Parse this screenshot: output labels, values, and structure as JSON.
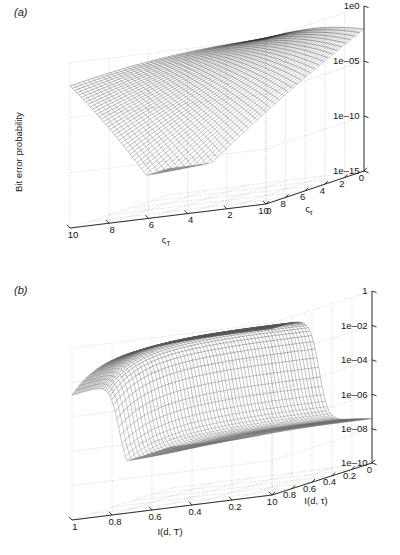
{
  "figure": {
    "background": "#ffffff",
    "panels": [
      "a",
      "b"
    ]
  },
  "panel_a": {
    "label": "(a)",
    "zlabel": "Bit error probability",
    "xlabel": "ςᴛ",
    "ylabel": "ςᴛ",
    "xlabel_base": "ς",
    "xlabel_sub": "τ",
    "ylabel_base": "ς",
    "ylabel_sub": "T",
    "z_ticks": [
      "1e0",
      "1e–05",
      "1e–10",
      "1e–15"
    ],
    "x_ticks": [
      "0",
      "2",
      "4",
      "6",
      "8",
      "10"
    ],
    "y_ticks": [
      "0",
      "2",
      "4",
      "6",
      "8",
      "10"
    ]
  },
  "panel_b": {
    "label": "(b)",
    "zlabel": "Bit error probability",
    "xlabel": "I(d, τ)",
    "ylabel": "I(d, T)",
    "z_ticks": [
      "1",
      "1e–02",
      "1e–04",
      "1e–06",
      "1e–08",
      "1e–10"
    ],
    "x_ticks": [
      "0",
      "0.2",
      "0.4",
      "0.6",
      "0.8",
      "1"
    ],
    "y_ticks": [
      "0",
      "0.2",
      "0.4",
      "0.6",
      "0.8",
      "1"
    ]
  },
  "chart_data": [
    {
      "type": "surface",
      "panel": "a",
      "title": "",
      "xlabel": "ςτ",
      "ylabel": "ςT",
      "zlabel": "Bit error probability",
      "xlim": [
        0,
        10
      ],
      "ylim": [
        0,
        10
      ],
      "zlim_log10": [
        -15,
        0
      ],
      "z_scale": "log",
      "z_tick_values": [
        1,
        1e-05,
        1e-10,
        1e-15
      ],
      "x_tick_values": [
        0,
        2,
        4,
        6,
        8,
        10
      ],
      "y_tick_values": [
        0,
        2,
        4,
        6,
        8,
        10
      ],
      "grid": true,
      "legend": "none",
      "description": "Monotonically decreasing bit error probability surface, maximum ~1e0 at (x=0,y=0) corner and minimum ~1e-12 toward the far (x=10,y=10) corner; mesh wireframe drawn in greyscale.",
      "surface_model": {
        "formula_log10_z": "-0.12 * (x*y) - 0.02*(x*x + y*y)",
        "nx": 41,
        "ny": 41
      },
      "sample_grid_log10_z": [
        [
          0.0,
          -0.3,
          -0.9,
          -1.9,
          -3.3,
          -5.0
        ],
        [
          -0.3,
          -0.9,
          -1.9,
          -3.3,
          -5.0,
          -7.1
        ],
        [
          -0.9,
          -1.9,
          -3.3,
          -5.0,
          -7.1,
          -9.5
        ],
        [
          -1.9,
          -3.3,
          -5.0,
          -7.1,
          -9.5,
          -11.0
        ],
        [
          -3.3,
          -5.0,
          -7.1,
          -9.5,
          -11.0,
          -11.8
        ],
        [
          -5.0,
          -7.1,
          -9.5,
          -11.0,
          -11.8,
          -12.3
        ]
      ]
    },
    {
      "type": "surface",
      "panel": "b",
      "title": "",
      "xlabel": "I(d, τ)",
      "ylabel": "I(d, T)",
      "zlabel": "Bit error probability",
      "xlim": [
        0,
        1
      ],
      "ylim": [
        0,
        1
      ],
      "zlim_log10": [
        -10,
        0
      ],
      "z_scale": "log",
      "z_tick_values": [
        1,
        0.01,
        0.0001,
        1e-06,
        1e-08,
        1e-10
      ],
      "x_tick_values": [
        0,
        0.2,
        0.4,
        0.6,
        0.8,
        1
      ],
      "y_tick_values": [
        0,
        0.2,
        0.4,
        0.6,
        0.8,
        1
      ],
      "grid": true,
      "legend": "none",
      "description": "Plateau near 1 for small I(d,tau) then a sharp cliff dropping several decades; the surface falls off steeply near I(d,tau)~0.45 and again at the far I(d,T)~1 edge, bottoming near 1e-7.",
      "surface_model": {
        "formula_log10_z": "plateau then steep cliff in x, mild decay in y",
        "nx": 61,
        "ny": 61
      },
      "sample_grid_log10_z": [
        [
          -0.1,
          -0.15,
          -0.2,
          -0.3,
          -0.5,
          -1.2
        ],
        [
          -0.15,
          -0.2,
          -0.3,
          -0.45,
          -0.8,
          -1.9
        ],
        [
          -0.3,
          -0.4,
          -0.6,
          -0.9,
          -1.5,
          -3.0
        ],
        [
          -0.9,
          -1.2,
          -1.6,
          -2.2,
          -3.2,
          -5.0
        ],
        [
          -2.6,
          -3.0,
          -3.6,
          -4.3,
          -5.2,
          -6.6
        ],
        [
          -5.0,
          -5.3,
          -5.7,
          -6.1,
          -6.6,
          -7.2
        ]
      ]
    }
  ]
}
